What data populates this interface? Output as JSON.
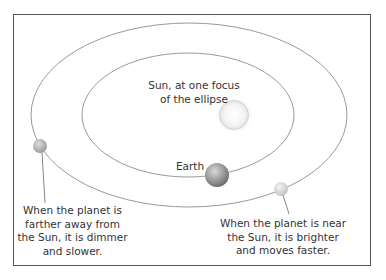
{
  "diagram": {
    "labels": {
      "sun": [
        "Sun, at one focus",
        "of the ellipse"
      ],
      "earth": "Earth",
      "far_planet": [
        "When the planet is",
        "farther away from",
        "the Sun, it is dimmer",
        "and slower."
      ],
      "near_planet": [
        "When the planet is near",
        "the Sun, it is brighter",
        "and moves faster."
      ]
    },
    "orbits": {
      "outer": {
        "cx": 189,
        "cy": 115,
        "rx": 158,
        "ry": 92
      },
      "inner": {
        "cx": 188,
        "cy": 115,
        "rx": 106,
        "ry": 62
      }
    },
    "bodies": {
      "sun": {
        "cx": 234,
        "cy": 115,
        "r": 15
      },
      "earth": {
        "cx": 217,
        "cy": 175,
        "r": 12
      },
      "far_planet": {
        "cx": 40,
        "cy": 146,
        "r": 7
      },
      "near_planet": {
        "cx": 281,
        "cy": 189,
        "r": 7
      }
    },
    "colors": {
      "frame": "#555555",
      "orbit": "#9a9a9a",
      "text": "#333333"
    }
  }
}
